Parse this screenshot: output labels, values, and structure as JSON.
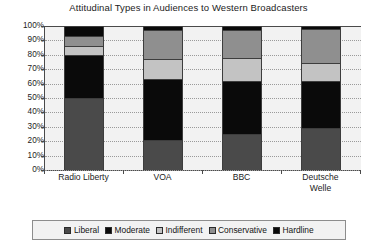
{
  "chart_data": {
    "type": "bar",
    "subtype": "stacked-column-100",
    "title": "Attitudinal Types in Audiences to Western Broadcasters",
    "xlabel": "",
    "ylabel": "",
    "ylim": [
      0,
      100
    ],
    "grid": true,
    "legend_position": "bottom",
    "categories": [
      "Radio Liberty",
      "VOA",
      "BBC",
      "Deutsche Welle"
    ],
    "category_lines": [
      [
        "Radio Liberty"
      ],
      [
        "VOA"
      ],
      [
        "BBC"
      ],
      [
        "Deutsche",
        "Welle"
      ]
    ],
    "y_tick_labels": [
      "100%",
      "90%",
      "80%",
      "70%",
      "60%",
      "50%",
      "40%",
      "30%",
      "20%",
      "10%",
      "0%"
    ],
    "y_tick_values": [
      100,
      90,
      80,
      70,
      60,
      50,
      40,
      30,
      20,
      10,
      0
    ],
    "series": [
      {
        "name": "Liberal",
        "color": "#4a4a4a",
        "values": [
          50,
          21,
          25,
          29
        ]
      },
      {
        "name": "Moderate",
        "color": "#0a0a0a",
        "values": [
          30,
          42,
          37,
          33
        ]
      },
      {
        "name": "Indifferent",
        "color": "#c3c3c3",
        "values": [
          6,
          14,
          16,
          12
        ]
      },
      {
        "name": "Conservative",
        "color": "#8f8f8f",
        "values": [
          7,
          20,
          19,
          24
        ]
      },
      {
        "name": "Hardline",
        "color": "#0a0a0a",
        "values": [
          7,
          3,
          3,
          2
        ]
      }
    ]
  },
  "legend": {
    "items": [
      {
        "label": "Liberal",
        "swatch": "#4a4a4a"
      },
      {
        "label": "Moderate",
        "swatch": "#0a0a0a"
      },
      {
        "label": "Indifferent",
        "swatch": "#c3c3c3"
      },
      {
        "label": "Conservative",
        "swatch": "#8f8f8f"
      },
      {
        "label": "Hardline",
        "swatch": "#0a0a0a"
      }
    ]
  },
  "style": {
    "plot_background": "#f2f2f2",
    "axis_color": "#4a4a4a",
    "grid_color": "#9a9a9a",
    "text_color": "#1c1c1c"
  }
}
